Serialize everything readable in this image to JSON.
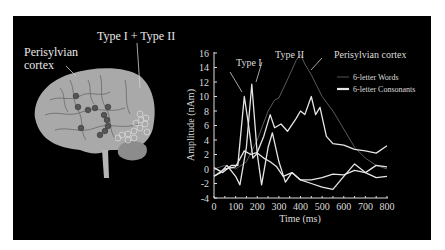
{
  "brain_panel": {
    "label_perisylvian_line1": "Perisylvian",
    "label_perisylvian_line2": "cortex",
    "label_type_combined": "Type I + Type II"
  },
  "chart_data": {
    "type": "line",
    "title": "",
    "xlabel": "Time (ms)",
    "ylabel": "Amplitude (nAm)",
    "xlim": [
      0,
      800
    ],
    "ylim": [
      -4,
      16
    ],
    "x_ticks": [
      0,
      100,
      200,
      300,
      400,
      500,
      600,
      700,
      800
    ],
    "y_ticks": [
      -4,
      -2,
      0,
      2,
      4,
      6,
      8,
      10,
      12,
      14,
      16
    ],
    "grid": false,
    "legend": {
      "position": "upper right",
      "entries": [
        {
          "label": "6-letter Words",
          "style": "thin dark gray line",
          "color": "#555555"
        },
        {
          "label": "6-letter Consonants",
          "style": "thick light line",
          "color": "#e6e6e6"
        }
      ]
    },
    "annotations": [
      {
        "text": "Type I",
        "x": 160,
        "y": 13.5
      },
      {
        "text": "Type II",
        "x": 370,
        "y": 15.8
      },
      {
        "text": "Perisylvian cortex",
        "x": 560,
        "y": 15.8
      }
    ],
    "series": [
      {
        "name": "6-letter Words (Type II / perisylvian)",
        "color": "#5a5a5a",
        "x": [
          0,
          50,
          100,
          150,
          200,
          250,
          280,
          300,
          350,
          380,
          400,
          420,
          450,
          500,
          550,
          600,
          650,
          700,
          750,
          800
        ],
        "y": [
          0,
          0.5,
          0,
          1,
          4,
          8,
          9.5,
          9.8,
          13,
          15,
          15.8,
          14.5,
          13,
          10,
          8,
          5.5,
          3,
          1.5,
          0.5,
          0
        ]
      },
      {
        "name": "Type I Words",
        "color": "#e6e6e6",
        "x": [
          0,
          40,
          80,
          110,
          140,
          160,
          180,
          200,
          230,
          260,
          290,
          320,
          360,
          400,
          450,
          500,
          550,
          600,
          650,
          700,
          750,
          800
        ],
        "y": [
          0.2,
          -0.5,
          0.5,
          0.5,
          10,
          6,
          1.5,
          2.2,
          1.5,
          1,
          0.3,
          -1,
          -0.5,
          -1.5,
          -1.5,
          -1.2,
          -0.7,
          -0.8,
          -0.2,
          -0.5,
          -1.2,
          -1
        ]
      },
      {
        "name": "Type I Consonants",
        "color": "#e6e6e6",
        "x": [
          0,
          30,
          60,
          100,
          120,
          150,
          175,
          200,
          220,
          250,
          270,
          300,
          330,
          360,
          400,
          450,
          500,
          550,
          600,
          650,
          700,
          750,
          800
        ],
        "y": [
          -1,
          -0.5,
          0.5,
          -1,
          -2.2,
          3,
          11.7,
          2,
          -2.2,
          3,
          5,
          1,
          -1.8,
          -0.5,
          -1.5,
          -2,
          -2.5,
          -2.8,
          -1,
          0.7,
          -0.5,
          0.5,
          0.3
        ]
      },
      {
        "name": "Perisylvian Consonants",
        "color": "#e6e6e6",
        "x": [
          0,
          50,
          100,
          140,
          170,
          200,
          230,
          260,
          280,
          310,
          340,
          380,
          400,
          420,
          450,
          470,
          490,
          520,
          550,
          600,
          650,
          700,
          750,
          800
        ],
        "y": [
          -1,
          0,
          0.3,
          2.5,
          2,
          2.3,
          4.5,
          7.5,
          5.7,
          6.2,
          5.2,
          7,
          8,
          7.5,
          10,
          7.5,
          8.5,
          4.5,
          3.5,
          3.3,
          2.7,
          2.5,
          2.2,
          3.2
        ]
      }
    ]
  }
}
